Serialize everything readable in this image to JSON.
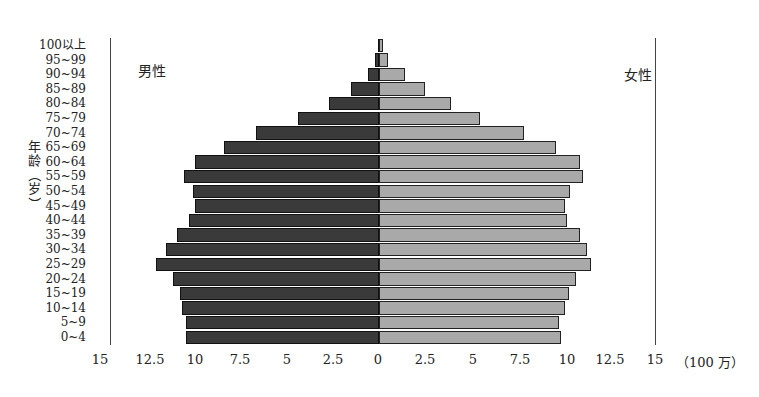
{
  "chart_data": {
    "type": "bar",
    "orientation": "horizontal",
    "subtype": "population-pyramid",
    "title": "",
    "ylabel": "年龄（岁）",
    "xlabel": "（100万）",
    "unit": "100万",
    "xlim": [
      -15,
      15
    ],
    "x_ticks_left": [
      "15",
      "12.5",
      "10",
      "7.5",
      "5",
      "2.5",
      "0"
    ],
    "x_ticks_right": [
      "2.5",
      "5",
      "7.5",
      "10",
      "12.5",
      "15"
    ],
    "categories": [
      "100以上",
      "95~99",
      "90~94",
      "85~89",
      "80~84",
      "75~79",
      "70~74",
      "65~69",
      "60~64",
      "55~59",
      "50~54",
      "45~49",
      "40~44",
      "35~39",
      "30~34",
      "25~29",
      "20~24",
      "15~19",
      "10~14",
      "5~9",
      "0~4"
    ],
    "series": [
      {
        "name": "男性",
        "color": "#3a3a3a",
        "side": "left",
        "values": [
          0.05,
          0.2,
          0.6,
          1.5,
          2.7,
          4.4,
          6.7,
          8.4,
          10.0,
          10.6,
          10.1,
          10.0,
          10.3,
          11.0,
          11.6,
          12.1,
          11.2,
          10.8,
          10.7,
          10.5,
          10.5
        ]
      },
      {
        "name": "女性",
        "color": "#a9a9a9",
        "side": "right",
        "values": [
          0.2,
          0.5,
          1.4,
          2.5,
          3.9,
          5.5,
          7.9,
          9.6,
          10.9,
          11.1,
          10.4,
          10.1,
          10.2,
          10.9,
          11.3,
          11.5,
          10.7,
          10.3,
          10.1,
          9.8,
          9.9
        ]
      }
    ],
    "grid": false,
    "legend": {
      "position": "inline",
      "male_label_pos": "top-left",
      "female_label_pos": "top-right"
    }
  },
  "labels": {
    "male": "男性",
    "female": "女性",
    "y_title_chars": [
      "年",
      "龄",
      "（",
      "岁",
      "）"
    ],
    "unit": "（100 万）"
  }
}
